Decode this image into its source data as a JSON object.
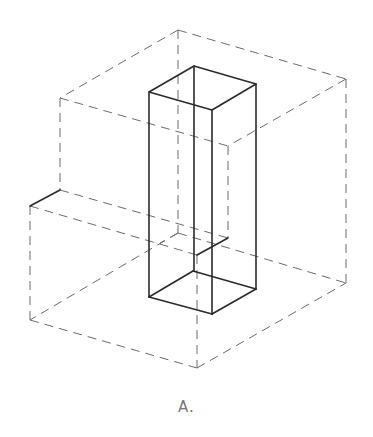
{
  "figure": {
    "caption": "A.",
    "colors": {
      "background": "#ffffff",
      "hidden_lines": "#6a6a6a",
      "visible_lines": "#2a2a2a",
      "caption": "#777777"
    }
  }
}
